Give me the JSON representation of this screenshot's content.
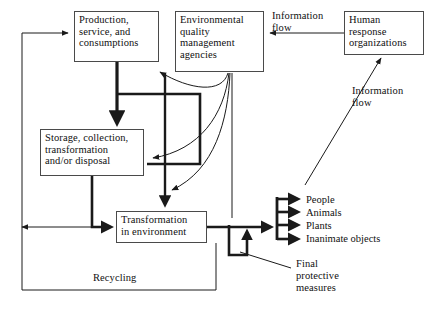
{
  "diagram": {
    "background_color": "#ffffff",
    "line_color": "#1a1a1a",
    "box_border_color": "#4a4a4a",
    "nodes": [
      {
        "id": "production",
        "label": "Production,\nservice, and\nconsumptions",
        "x": 74,
        "y": 11,
        "w": 85,
        "h": 51
      },
      {
        "id": "eqma",
        "label": "Environmental\nquality\nmanagement\nagencies",
        "x": 175,
        "y": 11,
        "w": 89,
        "h": 61
      },
      {
        "id": "human-response",
        "label": "Human\nresponse\norganizations",
        "x": 344,
        "y": 11,
        "w": 80,
        "h": 44
      },
      {
        "id": "storage",
        "label": "Storage, collection,\ntransformation\nand/or disposal",
        "x": 40,
        "y": 129,
        "w": 104,
        "h": 47
      },
      {
        "id": "transformation",
        "label": "Transformation\nin environment",
        "x": 116,
        "y": 211,
        "w": 91,
        "h": 32
      }
    ],
    "edge_labels": [
      {
        "id": "information-flow-top",
        "text": "Information\nflow",
        "x": 272,
        "y": 10
      },
      {
        "id": "information-flow-right",
        "text": "Information\nflow",
        "x": 352,
        "y": 85
      },
      {
        "id": "recycling",
        "text": "Recycling",
        "x": 93,
        "y": 272
      },
      {
        "id": "final-protective-measures",
        "text": "Final\nprotective\nmeasures",
        "x": 296,
        "y": 258
      }
    ],
    "receptors": [
      {
        "id": "people",
        "text": "People",
        "x": 306,
        "y": 201
      },
      {
        "id": "animals",
        "text": "Animals",
        "x": 306,
        "y": 213
      },
      {
        "id": "plants",
        "text": "Plants",
        "x": 306,
        "y": 226
      },
      {
        "id": "inanimate-objects",
        "text": "Inanimate objects",
        "x": 306,
        "y": 238
      }
    ]
  }
}
